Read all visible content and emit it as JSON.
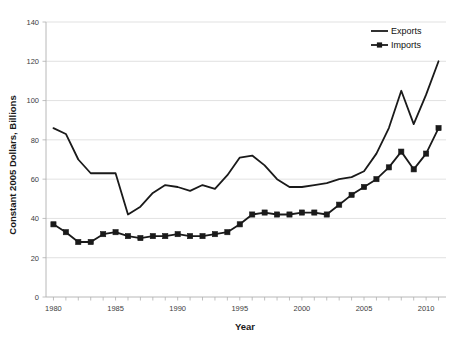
{
  "chart_data": {
    "type": "line",
    "title": "",
    "xlabel": "Year",
    "ylabel": "Constant 2005 Dollars, Billions",
    "xlim": [
      1979.4,
      2011.6
    ],
    "ylim": [
      0,
      140
    ],
    "ytick_step": 20,
    "yticks": [
      0,
      20,
      40,
      60,
      80,
      100,
      120,
      140
    ],
    "ytick_labels": [
      "0",
      "20",
      "40",
      "60",
      "80",
      "100",
      "120",
      "140"
    ],
    "xticks": [
      1980,
      1985,
      1990,
      1995,
      2000,
      2005,
      2010
    ],
    "xtick_labels": [
      "1980",
      "1985",
      "1990",
      "1995",
      "2000",
      "2005",
      "2010"
    ],
    "minor_xticks_every": 1,
    "grid": "horizontal",
    "grid_color": "#d9d9d9",
    "legend_position": "top-right",
    "line_color": "#1a1a1a",
    "x": [
      1980,
      1981,
      1982,
      1983,
      1984,
      1985,
      1986,
      1987,
      1988,
      1989,
      1990,
      1991,
      1992,
      1993,
      1994,
      1995,
      1996,
      1997,
      1998,
      1999,
      2000,
      2001,
      2002,
      2003,
      2004,
      2005,
      2006,
      2007,
      2008,
      2009,
      2010,
      2011
    ],
    "series": [
      {
        "name": "Exports",
        "marker": "none",
        "values": [
          86,
          83,
          70,
          63,
          63,
          63,
          42,
          46,
          53,
          57,
          56,
          54,
          57,
          55,
          62,
          71,
          72,
          67,
          60,
          56,
          56,
          57,
          58,
          60,
          61,
          64,
          73,
          86,
          105,
          88,
          103,
          120
        ]
      },
      {
        "name": "Imports",
        "marker": "square",
        "values": [
          37,
          33,
          28,
          28,
          32,
          33,
          31,
          30,
          31,
          31,
          32,
          31,
          31,
          32,
          33,
          37,
          42,
          43,
          42,
          42,
          43,
          43,
          42,
          47,
          52,
          56,
          60,
          66,
          74,
          65,
          73,
          86
        ]
      }
    ]
  },
  "legend": {
    "items": [
      {
        "label": "Exports",
        "marker": "line"
      },
      {
        "label": "Imports",
        "marker": "line-square"
      }
    ]
  },
  "caption": {
    "text": ""
  }
}
